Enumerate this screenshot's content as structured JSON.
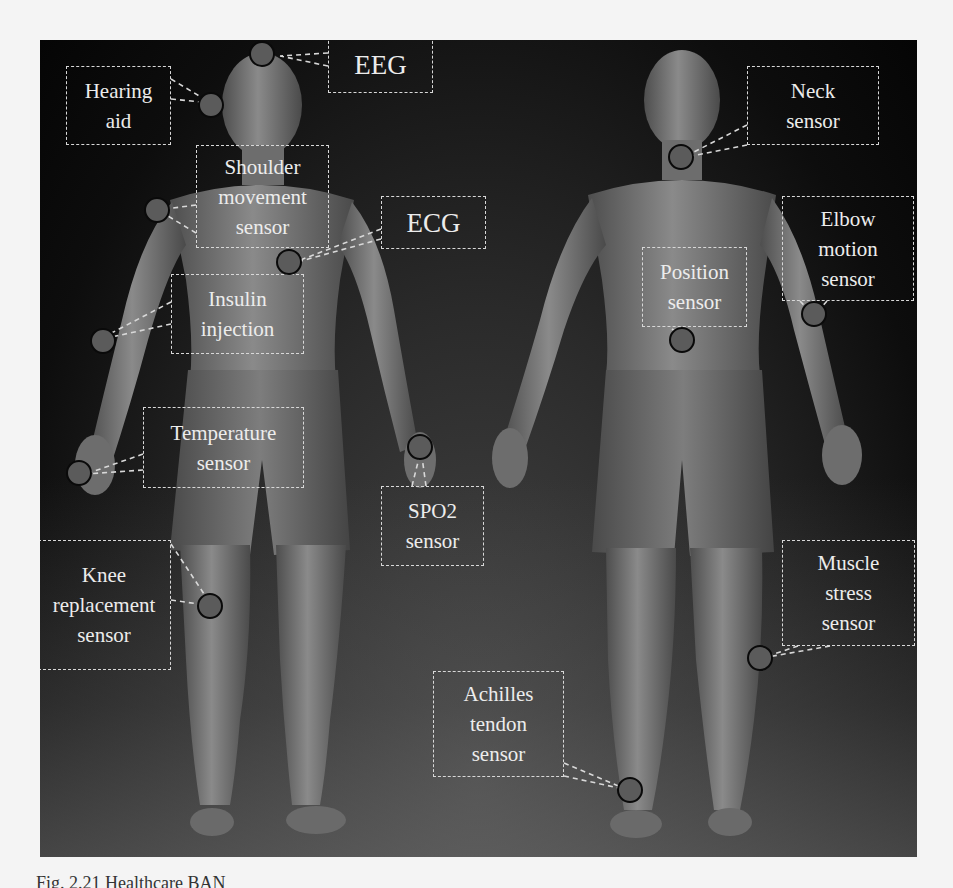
{
  "figure": {
    "background_color": "#0d0d0d",
    "skin_color": "#7a7a7a",
    "label_color": "#ececec",
    "dot_fill": "#5b5b5b",
    "dot_border": "#0a0a0a",
    "views": [
      "front",
      "back"
    ]
  },
  "labels": {
    "eeg": {
      "lines": [
        "EEG"
      ]
    },
    "hearing_aid": {
      "lines": [
        "Hearing",
        "aid"
      ]
    },
    "shoulder": {
      "lines": [
        "Shoulder",
        "movement",
        "sensor"
      ]
    },
    "ecg": {
      "lines": [
        "ECG"
      ]
    },
    "insulin": {
      "lines": [
        "Insulin",
        "injection"
      ]
    },
    "temperature": {
      "lines": [
        "Temperature",
        "sensor"
      ]
    },
    "spo2": {
      "lines": [
        "SPO2",
        "sensor"
      ]
    },
    "knee": {
      "lines": [
        "Knee",
        "replacement",
        "sensor"
      ]
    },
    "neck": {
      "lines": [
        "Neck",
        "sensor"
      ]
    },
    "elbow": {
      "lines": [
        "Elbow",
        "motion",
        "sensor"
      ]
    },
    "position": {
      "lines": [
        "Position",
        "sensor"
      ]
    },
    "muscle": {
      "lines": [
        "Muscle",
        "stress",
        "sensor"
      ]
    },
    "achilles": {
      "lines": [
        "Achilles",
        "tendon",
        "sensor"
      ]
    }
  },
  "caption": "Fig. 2.21  Healthcare BAN"
}
